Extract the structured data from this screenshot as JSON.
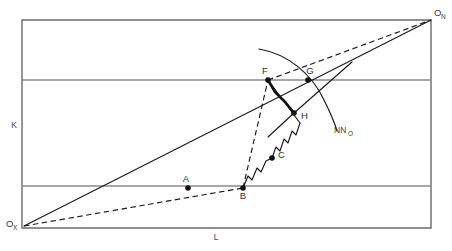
{
  "figure": {
    "type": "technical-line-diagram",
    "background_color": "#ffffff",
    "line_color": "#1a1a1a",
    "frame_color": "#6b6b6b",
    "width": 452,
    "height": 251
  },
  "axes": {
    "vertical_label": "K",
    "horizontal_label": "L",
    "origin_lower_left": {
      "base": "O",
      "subscript": "X"
    },
    "origin_upper_right": {
      "base": "O",
      "subscript": "N"
    }
  },
  "frame": {
    "left": 22,
    "right": 431,
    "top": 20,
    "bottom": 228,
    "isoquant_lines_y": [
      80,
      186
    ]
  },
  "points": [
    {
      "id": "A",
      "label": "A",
      "x": 188,
      "y": 188,
      "label_dx": 0,
      "label_dy": -6,
      "dot": true
    },
    {
      "id": "B",
      "label": "B",
      "x": 243,
      "y": 188,
      "label_dx": 0,
      "label_dy": 11,
      "dot": true
    },
    {
      "id": "C",
      "label": "C",
      "x": 272,
      "y": 158,
      "label_dx": 5,
      "label_dy": 0,
      "dot": true
    },
    {
      "id": "F",
      "label": "F",
      "x": 268,
      "y": 80,
      "label_dx": -2,
      "label_dy": -6,
      "dot": true
    },
    {
      "id": "G",
      "label": "G",
      "x": 308,
      "y": 80,
      "label_dx": 0,
      "label_dy": -6,
      "dot": true
    },
    {
      "id": "H",
      "label": "H",
      "x": 294,
      "y": 113,
      "label_dx": 6,
      "label_dy": 4,
      "dot": true
    }
  ],
  "curve": {
    "label_base": "NN",
    "label_subscript": "O",
    "label_x": 334,
    "label_y": 133
  },
  "rays": {
    "solid_expansion_path_label": "O_X to O_N solid ray",
    "dashed_expansion_path_label": "O_X to O_N dashed ray"
  },
  "segments": {
    "zigzag_lower_label": "B to F stepped path",
    "zigzag_upper_label": "F to H thick stepped path",
    "dashed_bf_label": "B to F dashed chord"
  }
}
